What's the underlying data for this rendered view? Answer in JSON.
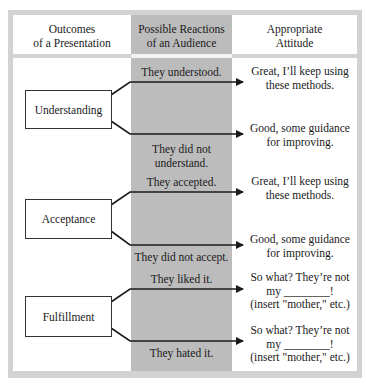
{
  "headers": {
    "outcomes": [
      "Outcomes",
      "of a Presentation"
    ],
    "reactions": [
      "Possible Reactions",
      "of an Audience"
    ],
    "attitude": [
      "Appropriate",
      "Attitude"
    ]
  },
  "rows": [
    {
      "outcome": "Understanding",
      "positive_reaction": "They understood.",
      "negative_reaction": [
        "They did not",
        "understand."
      ],
      "positive_attitude": [
        "Great, I’ll keep using",
        "these methods."
      ],
      "negative_attitude": [
        "Good, some guidance",
        "for improving."
      ]
    },
    {
      "outcome": "Acceptance",
      "positive_reaction": "They accepted.",
      "negative_reaction": [
        "They did not accept."
      ],
      "positive_attitude": [
        "Great, I’ll keep using",
        "these methods."
      ],
      "negative_attitude": [
        "Good, some guidance",
        "for improving."
      ]
    },
    {
      "outcome": "Fulfillment",
      "positive_reaction": "They liked it.",
      "negative_reaction": [
        "They hated it."
      ],
      "positive_attitude": [
        "So what?  They’re not",
        "my ________!",
        "(insert \"mother,\" etc.)"
      ],
      "negative_attitude": [
        "So what?  They’re not",
        "my ________!",
        "(insert \"mother,\" etc.)"
      ]
    }
  ],
  "colors": {
    "frame": "#d2d2d2",
    "reaction_column": "#bcbcbc",
    "line": "#1a1a1a"
  }
}
